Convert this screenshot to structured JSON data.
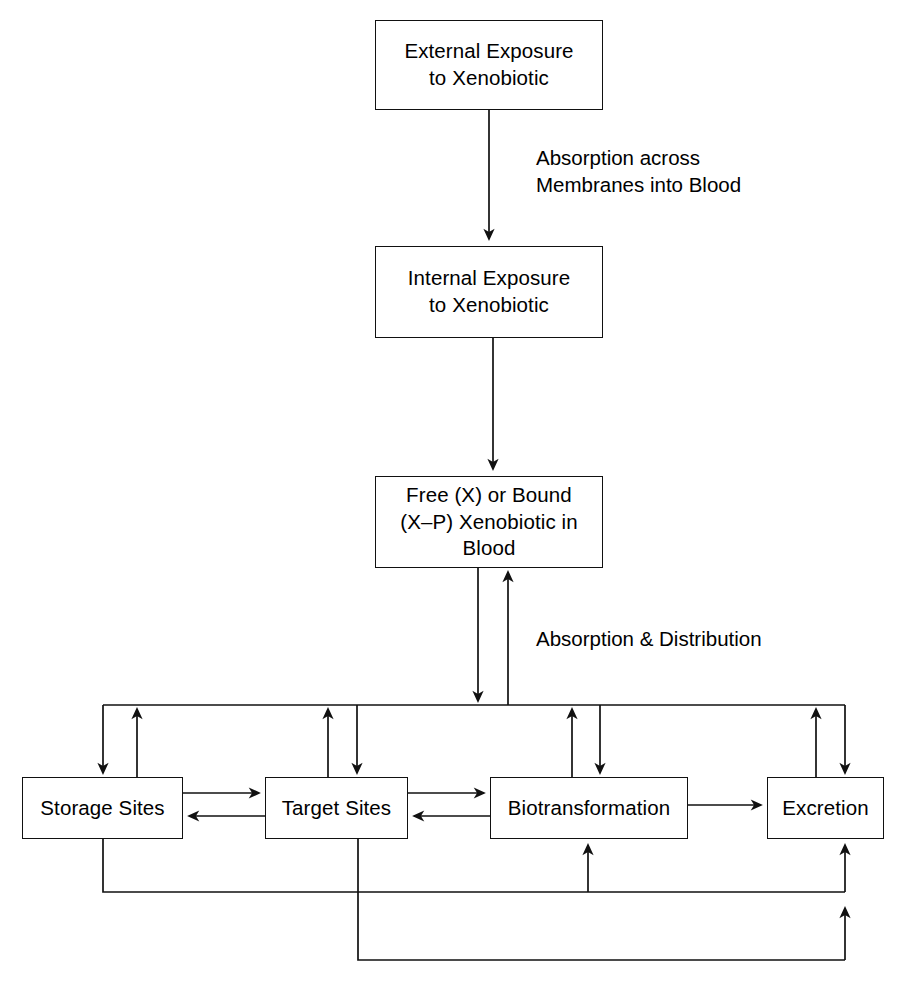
{
  "diagram": {
    "type": "flowchart",
    "stroke_color": "#111111",
    "background_color": "#ffffff",
    "nodes": [
      {
        "id": "external",
        "label": "External Exposure\nto Xenobiotic"
      },
      {
        "id": "internal",
        "label": "Internal Exposure\nto Xenobiotic"
      },
      {
        "id": "freebound",
        "label": "Free (X) or Bound\n(X–P) Xenobiotic in\nBlood"
      },
      {
        "id": "storage",
        "label": "Storage Sites"
      },
      {
        "id": "target",
        "label": "Target Sites"
      },
      {
        "id": "biotrans",
        "label": "Biotransformation"
      },
      {
        "id": "excretion",
        "label": "Excretion"
      }
    ],
    "edge_labels": [
      {
        "id": "absorption-membranes",
        "label": "Absorption across\nMembranes into Blood"
      },
      {
        "id": "absorption-distribution",
        "label": "Absorption & Distribution"
      }
    ],
    "edges": [
      {
        "from": "external",
        "to": "internal",
        "label": "Absorption across Membranes into Blood",
        "direction": "down"
      },
      {
        "from": "internal",
        "to": "freebound",
        "label": "",
        "direction": "down"
      },
      {
        "from": "freebound",
        "to": "bus",
        "label": "Absorption & Distribution",
        "direction": "down"
      },
      {
        "from": "bus",
        "to": "freebound",
        "label": "Absorption & Distribution",
        "direction": "up"
      },
      {
        "from": "bus",
        "to": "storage",
        "direction": "down"
      },
      {
        "from": "storage",
        "to": "bus",
        "direction": "up"
      },
      {
        "from": "bus",
        "to": "target",
        "direction": "down"
      },
      {
        "from": "target",
        "to": "bus",
        "direction": "up"
      },
      {
        "from": "bus",
        "to": "biotrans",
        "direction": "down"
      },
      {
        "from": "biotrans",
        "to": "bus",
        "direction": "up"
      },
      {
        "from": "bus",
        "to": "excretion",
        "direction": "down"
      },
      {
        "from": "excretion",
        "to": "bus",
        "direction": "up"
      },
      {
        "from": "storage",
        "to": "target",
        "direction": "right"
      },
      {
        "from": "target",
        "to": "storage",
        "direction": "left"
      },
      {
        "from": "target",
        "to": "biotrans",
        "direction": "right"
      },
      {
        "from": "biotrans",
        "to": "target",
        "direction": "left"
      },
      {
        "from": "biotrans",
        "to": "excretion",
        "direction": "right"
      },
      {
        "from": "storage",
        "to": "biotrans",
        "direction": "bottom-bus-1"
      },
      {
        "from": "storage",
        "to": "excretion",
        "direction": "bottom-bus-1"
      },
      {
        "from": "target",
        "to": "excretion",
        "direction": "bottom-bus-2"
      }
    ]
  }
}
